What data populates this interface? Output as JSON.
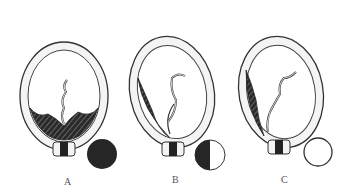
{
  "figure": {
    "panels": [
      {
        "id": "A",
        "label": "A",
        "indicator": "full-dark-circle",
        "indicator_color": "#262626"
      },
      {
        "id": "B",
        "label": "B",
        "indicator": "half-dark-circle",
        "indicator_color": "#262626"
      },
      {
        "id": "C",
        "label": "C",
        "indicator": "empty-circle",
        "indicator_color": "#ffffff"
      }
    ]
  }
}
